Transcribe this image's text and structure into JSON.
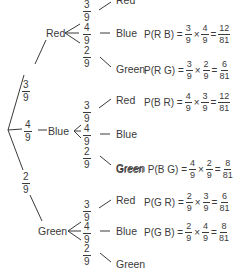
{
  "diagram": {
    "type": "probability-tree",
    "first_level": [
      {
        "label": "Red",
        "prob": {
          "n": "3",
          "d": "9"
        }
      },
      {
        "label": "Blue",
        "prob": {
          "n": "4",
          "d": "9"
        }
      },
      {
        "label": "Green",
        "prob": {
          "n": "2",
          "d": "9"
        }
      }
    ],
    "branches": {
      "red": {
        "label": "Red",
        "probs": [
          {
            "n": "3",
            "d": "9"
          },
          {
            "n": "4",
            "d": "9"
          },
          {
            "n": "2",
            "d": "9"
          }
        ],
        "outcomes": [
          "Red",
          "Blue",
          "Green"
        ],
        "formulas": {
          "rb": {
            "lhs": "P(R B) =",
            "a": {
              "n": "3",
              "d": "9"
            },
            "b": {
              "n": "4",
              "d": "9"
            },
            "r": {
              "n": "12",
              "d": "81"
            }
          },
          "rg": {
            "lhs": "P(R G) =",
            "a": {
              "n": "3",
              "d": "9"
            },
            "b": {
              "n": "2",
              "d": "9"
            },
            "r": {
              "n": "6",
              "d": "81"
            }
          }
        }
      },
      "blue": {
        "label": "Blue",
        "probs": [
          {
            "n": "3",
            "d": "9"
          },
          {
            "n": "4",
            "d": "9"
          },
          {
            "n": "2",
            "d": "9"
          }
        ],
        "outcomes": [
          "Red",
          "Blue",
          "Green"
        ],
        "formulas": {
          "br": {
            "lhs": "P(B R) =",
            "a": {
              "n": "4",
              "d": "9"
            },
            "b": {
              "n": "3",
              "d": "9"
            },
            "r": {
              "n": "12",
              "d": "81"
            }
          },
          "bg": {
            "lhs": "P(B G) =",
            "a": {
              "n": "4",
              "d": "9"
            },
            "b": {
              "n": "2",
              "d": "9"
            },
            "r": {
              "n": "8",
              "d": "81"
            }
          }
        }
      },
      "green": {
        "label": "Green",
        "probs": [
          {
            "n": "3",
            "d": "9"
          },
          {
            "n": "4",
            "d": "9"
          },
          {
            "n": "2",
            "d": "9"
          }
        ],
        "outcomes": [
          "Red",
          "Blue",
          "Green"
        ],
        "formulas": {
          "gr": {
            "lhs": "P(G R) =",
            "a": {
              "n": "2",
              "d": "9"
            },
            "b": {
              "n": "3",
              "d": "9"
            },
            "r": {
              "n": "6",
              "d": "81"
            }
          },
          "gb": {
            "lhs": "P(G B) =",
            "a": {
              "n": "2",
              "d": "9"
            },
            "b": {
              "n": "4",
              "d": "9"
            },
            "r": {
              "n": "8",
              "d": "81"
            }
          }
        }
      }
    },
    "symbols": {
      "times": "×",
      "equals": "="
    },
    "line_color": "#3a3a3a"
  }
}
